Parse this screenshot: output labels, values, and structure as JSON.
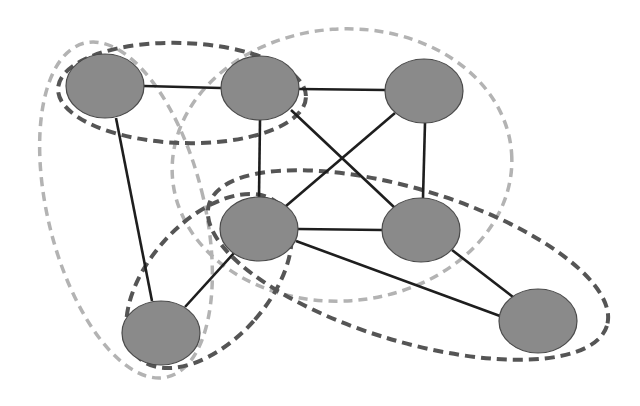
{
  "diagram": {
    "type": "graph-with-overlapping-communities",
    "node_fill": "#8a8a8a",
    "edge_color": "#1e1e1e",
    "nodes": [
      {
        "id": "n1",
        "cx": 105,
        "cy": 86
      },
      {
        "id": "n2",
        "cx": 260,
        "cy": 88
      },
      {
        "id": "n3",
        "cx": 424,
        "cy": 91
      },
      {
        "id": "n4",
        "cx": 259,
        "cy": 229
      },
      {
        "id": "n5",
        "cx": 421,
        "cy": 230
      },
      {
        "id": "n6",
        "cx": 538,
        "cy": 321
      },
      {
        "id": "n7",
        "cx": 161,
        "cy": 333
      }
    ],
    "edges": [
      [
        "n1",
        "n2"
      ],
      [
        "n2",
        "n3"
      ],
      [
        "n1",
        "n7"
      ],
      [
        "n2",
        "n4"
      ],
      [
        "n2",
        "n5"
      ],
      [
        "n3",
        "n4"
      ],
      [
        "n3",
        "n5"
      ],
      [
        "n4",
        "n5"
      ],
      [
        "n4",
        "n6"
      ],
      [
        "n5",
        "n6"
      ],
      [
        "n4",
        "n7"
      ]
    ],
    "groups": [
      {
        "id": "group-n1-n2",
        "members": [
          "n1",
          "n2"
        ],
        "style": "dark",
        "color": "#555555"
      },
      {
        "id": "group-n1-n7",
        "members": [
          "n1",
          "n7"
        ],
        "style": "light",
        "color": "#b3b3b3"
      },
      {
        "id": "group-n2-n3-n4-n5",
        "members": [
          "n2",
          "n3",
          "n4",
          "n5"
        ],
        "style": "light",
        "color": "#b3b3b3"
      },
      {
        "id": "group-n4-n5-n6",
        "members": [
          "n4",
          "n5",
          "n6"
        ],
        "style": "dark",
        "color": "#555555"
      },
      {
        "id": "group-n4-n7",
        "members": [
          "n4",
          "n7"
        ],
        "style": "dark",
        "color": "#555555"
      }
    ]
  }
}
